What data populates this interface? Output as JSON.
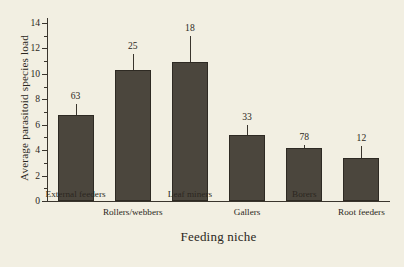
{
  "chart_data": {
    "type": "bar",
    "title": "",
    "xlabel": "Feeding niche",
    "ylabel": "Average parasitoid species load",
    "categories": [
      "External feeders",
      "Rollers/webbers",
      "Leaf miners",
      "Gallers",
      "Borers",
      "Root feeders"
    ],
    "values": [
      6.8,
      10.3,
      10.9,
      5.2,
      4.2,
      3.4
    ],
    "errors_upper": [
      7.6,
      11.6,
      13.0,
      6.0,
      4.4,
      4.3
    ],
    "point_labels": [
      "63",
      "25",
      "18",
      "33",
      "78",
      "12"
    ],
    "ylim": [
      0,
      15
    ],
    "yticks": [
      0,
      2,
      4,
      6,
      8,
      10,
      12,
      14
    ],
    "ytick_labels": [
      "0",
      "2",
      "4",
      "6",
      "8",
      "10",
      "12",
      "14"
    ],
    "yminor_ticks": [
      1,
      3,
      5,
      7,
      9,
      11,
      13
    ],
    "grid": false,
    "legend": "none",
    "bar_color": "#4b463d",
    "background_color": "#f2efe2",
    "axis_color": "#3a352d",
    "text_color": "#2b2721"
  }
}
